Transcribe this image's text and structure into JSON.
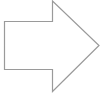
{
  "shape": {
    "type": "right-arrow",
    "stroke_color": "#9a9a9a",
    "fill_color": "#ffffff",
    "stroke_width": 1.2,
    "points": "4.5,21.5 52.5,21.5 52.5,1 99,45.5 52.5,91.5 52.5,69.5 4.5,69.5"
  }
}
